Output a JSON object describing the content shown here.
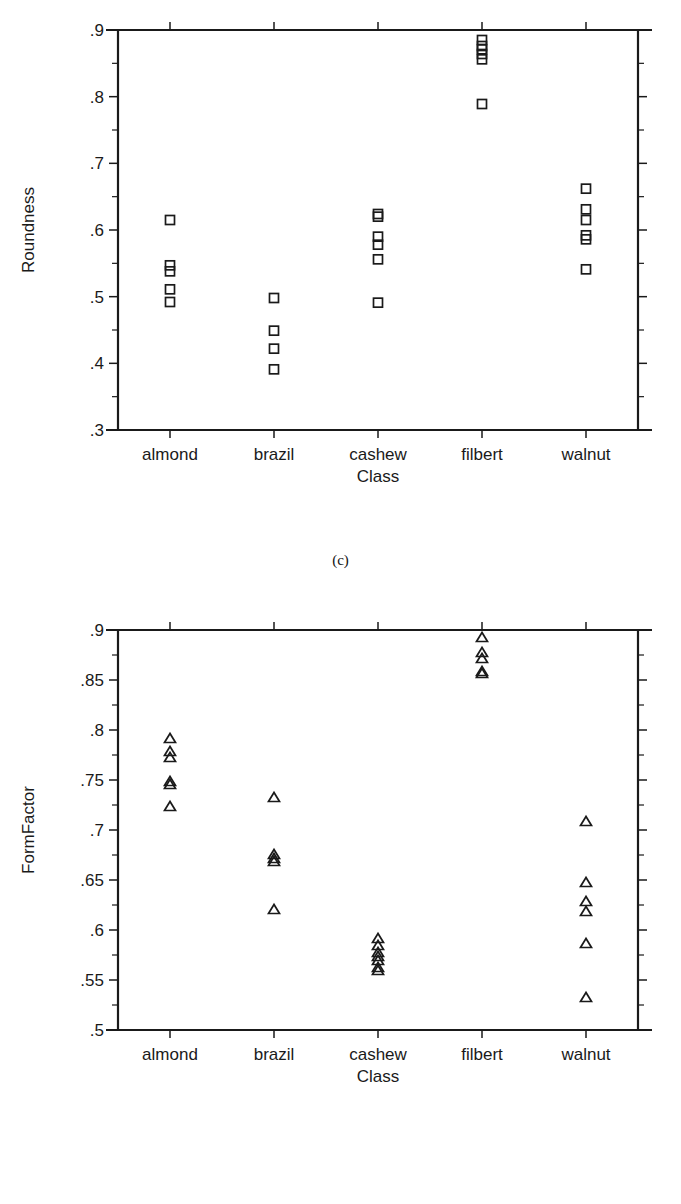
{
  "figures": [
    {
      "id": "c",
      "caption": "(c)",
      "chart_index": 0
    },
    {
      "id": "d",
      "caption": "(d)",
      "chart_index": 1
    }
  ],
  "chart_data": [
    {
      "type": "scatter",
      "title": "",
      "xlabel": "Class",
      "ylabel": "Roundness",
      "marker": "square",
      "grid": false,
      "legend": null,
      "categories": [
        "almond",
        "brazil",
        "cashew",
        "filbert",
        "walnut"
      ],
      "ylim": [
        0.3,
        0.9
      ],
      "ytick_labels": [
        ".3",
        ".4",
        ".5",
        ".6",
        ".7",
        ".8",
        ".9"
      ],
      "ytick_values": [
        0.3,
        0.4,
        0.5,
        0.6,
        0.7,
        0.8,
        0.9
      ],
      "yminor_values": [
        0.35,
        0.45,
        0.55,
        0.65,
        0.75,
        0.85
      ],
      "series": [
        {
          "name": "almond",
          "values": [
            0.615,
            0.547,
            0.538,
            0.511,
            0.492
          ]
        },
        {
          "name": "brazil",
          "values": [
            0.498,
            0.449,
            0.422,
            0.391
          ]
        },
        {
          "name": "cashew",
          "values": [
            0.624,
            0.62,
            0.59,
            0.578,
            0.556,
            0.491
          ]
        },
        {
          "name": "filbert",
          "values": [
            0.885,
            0.876,
            0.871,
            0.864,
            0.856,
            0.789
          ]
        },
        {
          "name": "walnut",
          "values": [
            0.662,
            0.631,
            0.615,
            0.592,
            0.586,
            0.541
          ]
        }
      ]
    },
    {
      "type": "scatter",
      "title": "",
      "xlabel": "Class",
      "ylabel": "FormFactor",
      "marker": "triangle",
      "grid": false,
      "legend": null,
      "categories": [
        "almond",
        "brazil",
        "cashew",
        "filbert",
        "walnut"
      ],
      "ylim": [
        0.5,
        0.9
      ],
      "ytick_labels": [
        ".5",
        ".55",
        ".6",
        ".65",
        ".7",
        ".75",
        ".8",
        ".85",
        ".9"
      ],
      "ytick_values": [
        0.5,
        0.55,
        0.6,
        0.65,
        0.7,
        0.75,
        0.8,
        0.85,
        0.9
      ],
      "yminor_values": [
        0.525,
        0.575,
        0.625,
        0.675,
        0.725,
        0.775,
        0.825,
        0.875
      ],
      "series": [
        {
          "name": "almond",
          "values": [
            0.792,
            0.779,
            0.773,
            0.749,
            0.746,
            0.724
          ]
        },
        {
          "name": "brazil",
          "values": [
            0.676,
            0.672,
            0.669,
            0.733,
            0.621
          ]
        },
        {
          "name": "cashew",
          "values": [
            0.592,
            0.585,
            0.578,
            0.574,
            0.57,
            0.563,
            0.56
          ]
        },
        {
          "name": "filbert",
          "values": [
            0.893,
            0.878,
            0.872,
            0.859,
            0.857
          ]
        },
        {
          "name": "walnut",
          "values": [
            0.709,
            0.648,
            0.629,
            0.619,
            0.587,
            0.533
          ]
        }
      ]
    }
  ]
}
